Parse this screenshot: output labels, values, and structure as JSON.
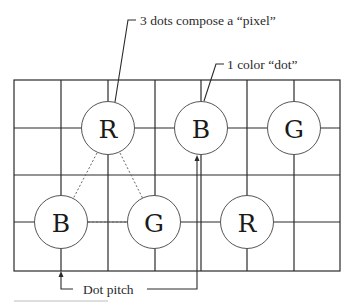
{
  "diagram": {
    "labels": {
      "pixel": "3 dots compose a “pixel”",
      "dot": "1 color “dot”",
      "pitch": "Dot pitch"
    },
    "top_row_dots": [
      {
        "letter": "R"
      },
      {
        "letter": "B"
      },
      {
        "letter": "G"
      }
    ],
    "bottom_row_dots": [
      {
        "letter": "B"
      },
      {
        "letter": "G"
      },
      {
        "letter": "R"
      }
    ]
  }
}
